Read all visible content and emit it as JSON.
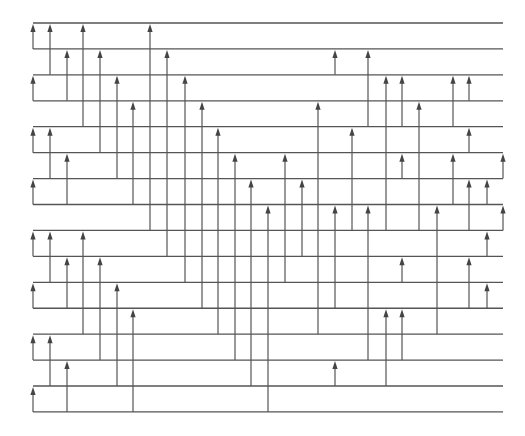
{
  "diagram": {
    "type": "network",
    "colors": {
      "background": "#ffffff",
      "line": "#555555",
      "arrow": "#444444"
    },
    "wires": {
      "count": 16,
      "x_start": 33,
      "x_end": 503,
      "y_first": 23,
      "y_step": 25.93
    },
    "columns_x": [
      33,
      50,
      67,
      83,
      100,
      117,
      133,
      150,
      167,
      185,
      202,
      218,
      235,
      251,
      268,
      285,
      302,
      318,
      335,
      352,
      368,
      386,
      402,
      419,
      437,
      453,
      469,
      487,
      503
    ],
    "arrows": [
      {
        "col": 0,
        "from": 1,
        "to": 0
      },
      {
        "col": 0,
        "from": 3,
        "to": 2
      },
      {
        "col": 0,
        "from": 5,
        "to": 4
      },
      {
        "col": 0,
        "from": 7,
        "to": 6
      },
      {
        "col": 0,
        "from": 9,
        "to": 8
      },
      {
        "col": 0,
        "from": 11,
        "to": 10
      },
      {
        "col": 0,
        "from": 13,
        "to": 12
      },
      {
        "col": 0,
        "from": 15,
        "to": 14
      },
      {
        "col": 1,
        "from": 2,
        "to": 0
      },
      {
        "col": 1,
        "from": 6,
        "to": 4
      },
      {
        "col": 1,
        "from": 10,
        "to": 8
      },
      {
        "col": 1,
        "from": 14,
        "to": 12
      },
      {
        "col": 2,
        "from": 3,
        "to": 1
      },
      {
        "col": 2,
        "from": 7,
        "to": 5
      },
      {
        "col": 2,
        "from": 11,
        "to": 9
      },
      {
        "col": 2,
        "from": 15,
        "to": 13
      },
      {
        "col": 3,
        "from": 4,
        "to": 0
      },
      {
        "col": 3,
        "from": 12,
        "to": 8
      },
      {
        "col": 4,
        "from": 5,
        "to": 1
      },
      {
        "col": 4,
        "from": 13,
        "to": 9
      },
      {
        "col": 5,
        "from": 6,
        "to": 2
      },
      {
        "col": 5,
        "from": 14,
        "to": 10
      },
      {
        "col": 6,
        "from": 7,
        "to": 3
      },
      {
        "col": 6,
        "from": 15,
        "to": 11
      },
      {
        "col": 7,
        "from": 8,
        "to": 0
      },
      {
        "col": 8,
        "from": 9,
        "to": 1
      },
      {
        "col": 9,
        "from": 10,
        "to": 2
      },
      {
        "col": 10,
        "from": 11,
        "to": 3
      },
      {
        "col": 11,
        "from": 12,
        "to": 4
      },
      {
        "col": 12,
        "from": 13,
        "to": 5
      },
      {
        "col": 13,
        "from": 14,
        "to": 6
      },
      {
        "col": 14,
        "from": 15,
        "to": 7
      },
      {
        "col": 15,
        "from": 10,
        "to": 5
      },
      {
        "col": 16,
        "from": 9,
        "to": 6
      },
      {
        "col": 17,
        "from": 12,
        "to": 3
      },
      {
        "col": 18,
        "from": 2,
        "to": 1
      },
      {
        "col": 18,
        "from": 11,
        "to": 7
      },
      {
        "col": 18,
        "from": 14,
        "to": 13
      },
      {
        "col": 19,
        "from": 8,
        "to": 4
      },
      {
        "col": 20,
        "from": 4,
        "to": 1
      },
      {
        "col": 20,
        "from": 13,
        "to": 7
      },
      {
        "col": 21,
        "from": 8,
        "to": 2
      },
      {
        "col": 21,
        "from": 14,
        "to": 11
      },
      {
        "col": 22,
        "from": 4,
        "to": 2
      },
      {
        "col": 22,
        "from": 6,
        "to": 5
      },
      {
        "col": 22,
        "from": 10,
        "to": 9
      },
      {
        "col": 22,
        "from": 13,
        "to": 11
      },
      {
        "col": 23,
        "from": 8,
        "to": 3
      },
      {
        "col": 24,
        "from": 12,
        "to": 7
      },
      {
        "col": 25,
        "from": 4,
        "to": 2
      },
      {
        "col": 25,
        "from": 7,
        "to": 5
      },
      {
        "col": 26,
        "from": 3,
        "to": 2
      },
      {
        "col": 26,
        "from": 5,
        "to": 4
      },
      {
        "col": 26,
        "from": 8,
        "to": 6
      },
      {
        "col": 26,
        "from": 11,
        "to": 9
      },
      {
        "col": 27,
        "from": 7,
        "to": 6
      },
      {
        "col": 27,
        "from": 9,
        "to": 8
      },
      {
        "col": 27,
        "from": 11,
        "to": 10
      },
      {
        "col": 28,
        "from": 6,
        "to": 5
      },
      {
        "col": 28,
        "from": 8,
        "to": 7
      }
    ]
  }
}
